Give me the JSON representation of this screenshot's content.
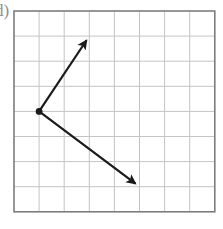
{
  "figure": {
    "label": "d)",
    "title": "Two vectors drawn on a square grid from a common origin point",
    "background_color": "#ffffff"
  },
  "grid": {
    "columns": 8,
    "rows": 8,
    "left": 14,
    "top": 11,
    "cell_size": 25.1,
    "line_color": "#c4c4c4",
    "border_color": "#7d7d7d",
    "border_width": 1.6,
    "line_width": 1
  },
  "vectors": {
    "color": "#1a1a1a",
    "line_width": 2.2,
    "origin_dot_radius": 3.4,
    "origin": {
      "col": 1,
      "row": 4,
      "x": 39.1,
      "y": 111.4
    },
    "items": [
      {
        "name": "vector-up-right",
        "from": {
          "col": 1,
          "row": 4
        },
        "to": {
          "col": 3,
          "row": 1
        },
        "components": {
          "dx": 2,
          "dy": 3
        },
        "tip_x": 89.3,
        "tip_y": 36.1,
        "direction": "up-right"
      },
      {
        "name": "vector-down-right",
        "from": {
          "col": 1,
          "row": 4
        },
        "to": {
          "col": 5,
          "row": 7
        },
        "components": {
          "dx": 4,
          "dy": -3
        },
        "tip_x": 139.5,
        "tip_y": 186.7,
        "direction": "down-right"
      }
    ]
  }
}
